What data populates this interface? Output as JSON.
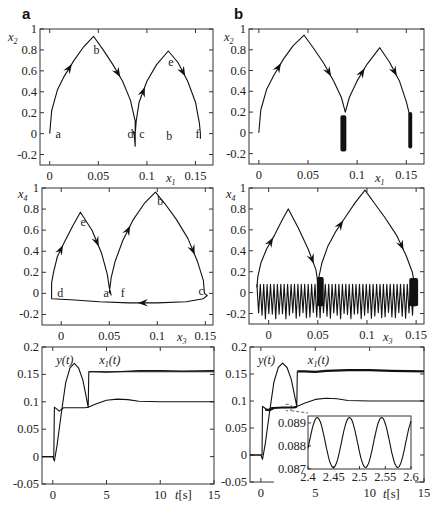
{
  "figure": {
    "panel_labels": [
      "a",
      "b"
    ]
  },
  "chart_data": [
    {
      "id": "a-top",
      "type": "line",
      "panel": "a",
      "title": "",
      "xlabel": "x1",
      "ylabel": "x2",
      "xlim": [
        -0.01,
        0.168
      ],
      "ylim": [
        -0.3,
        1.0
      ],
      "xticks": [
        0,
        0.05,
        0.1,
        0.15
      ],
      "yticks": [
        -0.2,
        0,
        0.2,
        0.4,
        0.6,
        0.8,
        1
      ],
      "xtick_labels": [
        "0",
        "0.05",
        "0.1",
        "0.15"
      ],
      "ytick_labels": [
        "-0.2",
        "0",
        "0.2",
        "0.4",
        "0.6",
        "0.8",
        "1"
      ],
      "annotations": [
        {
          "text": "a",
          "x": 0.006,
          "y": 0.0
        },
        {
          "text": "b",
          "x": 0.045,
          "y": 0.8
        },
        {
          "text": "d",
          "x": 0.08,
          "y": 0.0
        },
        {
          "text": "c",
          "x": 0.092,
          "y": 0.0
        },
        {
          "text": "e",
          "x": 0.122,
          "y": 0.68
        },
        {
          "text": "b",
          "x": 0.12,
          "y": -0.02
        },
        {
          "text": "f",
          "x": 0.15,
          "y": 0.0
        }
      ],
      "series": [
        {
          "name": "trajectory",
          "x": [
            0,
            0.002,
            0.008,
            0.015,
            0.025,
            0.035,
            0.045,
            0.055,
            0.065,
            0.075,
            0.083,
            0.088,
            0.088,
            0.087,
            0.086,
            0.088,
            0.089,
            0.092,
            0.1,
            0.11,
            0.122,
            0.132,
            0.142,
            0.15,
            0.154,
            0.155,
            0.155
          ],
          "y": [
            0,
            0.22,
            0.42,
            0.55,
            0.7,
            0.83,
            0.93,
            0.8,
            0.66,
            0.5,
            0.32,
            0.12,
            -0.12,
            -0.02,
            0.02,
            0.0,
            0.12,
            0.3,
            0.5,
            0.66,
            0.79,
            0.68,
            0.5,
            0.3,
            0.1,
            0.0,
            -0.05
          ]
        }
      ]
    },
    {
      "id": "b-top",
      "type": "line",
      "panel": "b",
      "title": "",
      "xlabel": "x1",
      "ylabel": "x2",
      "xlim": [
        -0.01,
        0.168
      ],
      "ylim": [
        -0.3,
        1.0
      ],
      "xticks": [
        0,
        0.05,
        0.1,
        0.15
      ],
      "yticks": [
        -0.2,
        0,
        0.2,
        0.4,
        0.6,
        0.8,
        1
      ],
      "xtick_labels": [
        "0",
        "0.05",
        "0.1",
        "0.15"
      ],
      "ytick_labels": [
        "-0.2",
        "0",
        "0.2",
        "0.4",
        "0.6",
        "0.8",
        "1"
      ],
      "series": [
        {
          "name": "trajectory",
          "x": [
            0,
            0.002,
            0.008,
            0.015,
            0.025,
            0.035,
            0.046,
            0.056,
            0.066,
            0.076,
            0.084,
            0.088,
            0.092,
            0.1,
            0.11,
            0.123,
            0.133,
            0.143,
            0.15,
            0.154,
            0.155
          ],
          "y": [
            0,
            0.22,
            0.42,
            0.55,
            0.71,
            0.84,
            0.94,
            0.81,
            0.67,
            0.5,
            0.34,
            0.2,
            0.34,
            0.5,
            0.66,
            0.82,
            0.68,
            0.5,
            0.3,
            0.15,
            0.05
          ]
        },
        {
          "name": "chatter-band-1",
          "x_range": [
            0.083,
            0.089
          ],
          "y_range": [
            -0.18,
            0.17
          ]
        },
        {
          "name": "chatter-band-2",
          "x_range": [
            0.152,
            0.156
          ],
          "y_range": [
            -0.15,
            0.2
          ]
        }
      ]
    },
    {
      "id": "a-mid",
      "type": "line",
      "panel": "a",
      "title": "",
      "xlabel": "x3",
      "ylabel": "x4",
      "xlim": [
        -0.02,
        0.158
      ],
      "ylim": [
        -0.3,
        1.0
      ],
      "xticks": [
        0,
        0.05,
        0.1,
        0.15
      ],
      "yticks": [
        -0.2,
        0,
        0.2,
        0.4,
        0.6,
        0.8,
        1
      ],
      "xtick_labels": [
        "0",
        "0.05",
        "0.1",
        "0.15"
      ],
      "ytick_labels": [
        "-0.2",
        "0",
        "0.2",
        "0.4",
        "0.6",
        "0.8",
        "1"
      ],
      "annotations": [
        {
          "text": "e",
          "x": 0.02,
          "y": 0.68
        },
        {
          "text": "b",
          "x": 0.1,
          "y": 0.88
        },
        {
          "text": "d",
          "x": -0.004,
          "y": 0.0
        },
        {
          "text": "a",
          "x": 0.044,
          "y": 0.0
        },
        {
          "text": "f",
          "x": 0.062,
          "y": 0.0
        },
        {
          "text": "c",
          "x": 0.143,
          "y": 0.02
        }
      ],
      "series": [
        {
          "name": "trajectory",
          "x": [
            0.05,
            0.052,
            0.056,
            0.064,
            0.075,
            0.087,
            0.098,
            0.108,
            0.12,
            0.132,
            0.142,
            0.148,
            0.149,
            0.152,
            0.148,
            0.13,
            0.1,
            0.07,
            0.04,
            0.01,
            -0.01,
            -0.01,
            -0.008,
            -0.004,
            0.003,
            0.012,
            0.02,
            0.032,
            0.042,
            0.048,
            0.05,
            0.052
          ],
          "y": [
            0.0,
            0.15,
            0.3,
            0.5,
            0.7,
            0.86,
            0.96,
            0.85,
            0.7,
            0.52,
            0.3,
            0.12,
            0.0,
            -0.02,
            -0.05,
            -0.08,
            -0.09,
            -0.09,
            -0.08,
            -0.06,
            -0.05,
            0.1,
            0.2,
            0.35,
            0.48,
            0.64,
            0.77,
            0.6,
            0.38,
            0.18,
            0.06,
            -0.02
          ]
        }
      ]
    },
    {
      "id": "b-mid",
      "type": "line",
      "panel": "b",
      "title": "",
      "xlabel": "x3",
      "ylabel": "x4",
      "xlim": [
        -0.02,
        0.158
      ],
      "ylim": [
        -0.3,
        1.0
      ],
      "xticks": [
        0,
        0.05,
        0.1,
        0.15
      ],
      "yticks": [
        -0.2,
        0,
        0.2,
        0.4,
        0.6,
        0.8,
        1
      ],
      "xtick_labels": [
        "0",
        "0.05",
        "0.1",
        "0.15"
      ],
      "ytick_labels": [
        "-0.2",
        "0",
        "0.2",
        "0.4",
        "0.6",
        "0.8",
        "1"
      ],
      "series": [
        {
          "name": "trajectory",
          "x": [
            -0.012,
            -0.011,
            -0.008,
            -0.002,
            0.006,
            0.014,
            0.02,
            0.03,
            0.04,
            0.048,
            0.05,
            0.054,
            0.06,
            0.068,
            0.078,
            0.088,
            0.098,
            0.108,
            0.118,
            0.13,
            0.14,
            0.146,
            0.148
          ],
          "y": [
            0.05,
            0.15,
            0.28,
            0.42,
            0.55,
            0.7,
            0.8,
            0.62,
            0.42,
            0.22,
            0.1,
            0.28,
            0.44,
            0.58,
            0.72,
            0.86,
            0.98,
            0.85,
            0.72,
            0.55,
            0.35,
            0.2,
            0.1
          ]
        },
        {
          "name": "oscillation-band",
          "x_range": [
            -0.012,
            0.148
          ],
          "y_range": [
            -0.22,
            0.08
          ],
          "cycles": 46
        },
        {
          "name": "chatter-band-1",
          "x_range": [
            0.049,
            0.056
          ],
          "y_range": [
            -0.13,
            0.15
          ]
        },
        {
          "name": "chatter-band-2",
          "x_range": [
            0.143,
            0.152
          ],
          "y_range": [
            -0.13,
            0.14
          ]
        }
      ]
    },
    {
      "id": "a-bot",
      "type": "line",
      "panel": "a",
      "title": "",
      "xlabel": "t[s]",
      "ylabel": "",
      "xlim": [
        -1,
        15
      ],
      "ylim": [
        -0.05,
        0.2
      ],
      "xticks": [
        0,
        5,
        10,
        15
      ],
      "yticks": [
        -0.05,
        0,
        0.05,
        0.1,
        0.15,
        0.2
      ],
      "xtick_labels": [
        "0",
        "5",
        "10",
        "15"
      ],
      "ytick_labels": [
        "-0.05",
        "0",
        "0.05",
        "0.1",
        "0.15",
        "0.2"
      ],
      "legend": [
        {
          "text": "y(t)",
          "x": 0.6,
          "y": 0.165
        },
        {
          "text": "x1(t)",
          "x": 4.5,
          "y": 0.165
        }
      ],
      "series": [
        {
          "name": "y(t)",
          "x": [
            -1,
            0,
            0.15,
            0.4,
            0.8,
            1.2,
            1.6,
            2.0,
            2.4,
            2.8,
            3.1,
            3.3,
            3.35,
            15
          ],
          "y": [
            0,
            0,
            -0.008,
            0.02,
            0.08,
            0.135,
            0.162,
            0.17,
            0.162,
            0.14,
            0.11,
            0.09,
            0.155,
            0.155
          ]
        },
        {
          "name": "y(t)-tail",
          "x": [
            3.35,
            4,
            5,
            6,
            8,
            10,
            12,
            15
          ],
          "y": [
            0.155,
            0.155,
            0.154,
            0.155,
            0.157,
            0.157,
            0.156,
            0.157
          ]
        },
        {
          "name": "x1(t)",
          "x": [
            -1,
            0,
            0.1,
            0.15,
            0.3,
            0.6,
            1.0,
            2.0,
            3.0,
            3.3,
            4,
            5,
            6,
            7,
            8,
            10,
            15
          ],
          "y": [
            0,
            0,
            0,
            0.09,
            0.088,
            0.083,
            0.089,
            0.089,
            0.089,
            0.09,
            0.096,
            0.103,
            0.105,
            0.104,
            0.101,
            0.1,
            0.1
          ]
        }
      ]
    },
    {
      "id": "b-bot",
      "type": "line",
      "panel": "b",
      "title": "",
      "xlabel": "t[s]",
      "ylabel": "",
      "xlim": [
        -1,
        15
      ],
      "ylim": [
        -0.05,
        0.2
      ],
      "xticks": [
        0,
        5,
        10,
        15
      ],
      "yticks": [
        -0.05,
        0,
        0.05,
        0.1,
        0.15,
        0.2
      ],
      "xtick_labels": [
        "0",
        "5",
        "10",
        "15"
      ],
      "ytick_labels": [
        "-0.05",
        "0",
        "0.05",
        "0.1",
        "0.15",
        "0.2"
      ],
      "legend": [
        {
          "text": "y(t)",
          "x": 0.0,
          "y": 0.165
        },
        {
          "text": "x1(t)",
          "x": 4.5,
          "y": 0.165
        }
      ],
      "series": [
        {
          "name": "y(t)",
          "x": [
            -1,
            0,
            0.15,
            0.4,
            0.8,
            1.2,
            1.6,
            2.0,
            2.4,
            2.8,
            3.1,
            3.3,
            3.35,
            15
          ],
          "y": [
            0,
            0,
            -0.008,
            0.02,
            0.08,
            0.135,
            0.162,
            0.17,
            0.162,
            0.14,
            0.11,
            0.09,
            0.155,
            0.155
          ]
        },
        {
          "name": "x1(t)",
          "x": [
            -1,
            0,
            0.1,
            0.15,
            0.3,
            0.6,
            1.0,
            2.0,
            3.0,
            3.3,
            4,
            5,
            6,
            7,
            8,
            10,
            15
          ],
          "y": [
            0,
            0,
            0,
            0.09,
            0.088,
            0.083,
            0.088,
            0.088,
            0.088,
            0.09,
            0.096,
            0.103,
            0.105,
            0.104,
            0.101,
            0.1,
            0.1
          ]
        }
      ],
      "inset": {
        "type": "line",
        "xlim": [
          2.4,
          2.6
        ],
        "ylim": [
          0.087,
          0.0893
        ],
        "xticks": [
          2.4,
          2.45,
          2.5,
          2.55,
          2.6
        ],
        "yticks": [
          0.087,
          0.088,
          0.089
        ],
        "xtick_labels": [
          "2.4",
          "2.45",
          "2.5",
          "2.55",
          "2.6"
        ],
        "ytick_labels": [
          "0.087",
          "0.088",
          "0.089"
        ],
        "series": [
          {
            "name": "x1(t) zoom",
            "function": "sine",
            "center": 0.08815,
            "amplitude": 0.00108,
            "period": 0.0625,
            "phase_peak_t": 2.418
          }
        ],
        "zoom_box": {
          "t": [
            2.2,
            2.8
          ],
          "y": [
            0.082,
            0.094
          ]
        }
      }
    }
  ]
}
